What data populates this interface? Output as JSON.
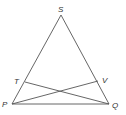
{
  "diagram": {
    "type": "geometry",
    "points": {
      "S": {
        "label": "S",
        "x": 61,
        "y": 15
      },
      "P": {
        "label": "P",
        "x": 12,
        "y": 104
      },
      "Q": {
        "label": "Q",
        "x": 109,
        "y": 104
      },
      "T": {
        "label": "T",
        "x": 25,
        "y": 82
      },
      "V": {
        "label": "V",
        "x": 98,
        "y": 81
      }
    },
    "segments": [
      {
        "from": "S",
        "to": "P"
      },
      {
        "from": "S",
        "to": "Q"
      },
      {
        "from": "P",
        "to": "Q"
      },
      {
        "from": "T",
        "to": "Q"
      },
      {
        "from": "P",
        "to": "V"
      }
    ],
    "labels": {
      "S": "S",
      "T": "T",
      "V": "V",
      "P": "P",
      "Q": "Q"
    },
    "line_color": "#555555",
    "label_color": "#333333"
  }
}
